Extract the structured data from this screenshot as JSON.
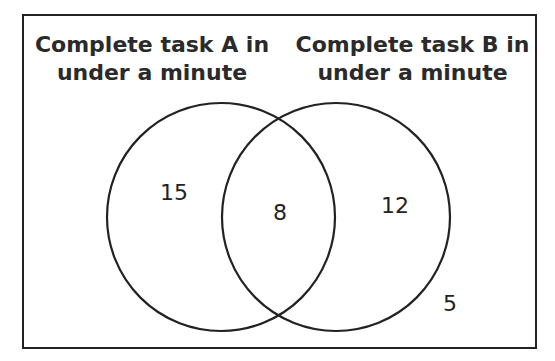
{
  "diagram": {
    "type": "venn",
    "sets": [
      {
        "id": "A",
        "label_line1": "Complete task A in",
        "label_line2": "under a minute",
        "only_count": "15"
      },
      {
        "id": "B",
        "label_line1": "Complete task B in",
        "label_line2": "under a minute",
        "only_count": "12"
      }
    ],
    "intersection_count": "8",
    "outside_count": "5"
  }
}
